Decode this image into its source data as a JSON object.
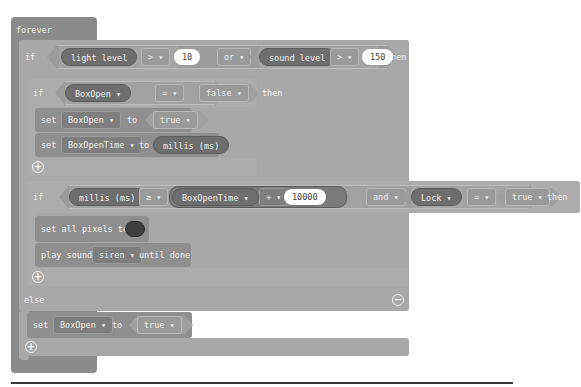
{
  "forever": {
    "label": "forever"
  },
  "if1": {
    "if_label": "if",
    "then_label": "then",
    "left": {
      "reporter": "light level",
      "op": "> ▾",
      "value": "10"
    },
    "logic": "or ▾",
    "right": {
      "reporter": "sound level",
      "op": "> ▾",
      "value": "150"
    }
  },
  "if2": {
    "if_label": "if",
    "then_label": "then",
    "variable": "BoxOpen ▾",
    "op": "= ▾",
    "value": "false ▾",
    "statements": [
      {
        "set_label": "set",
        "variable": "BoxOpen ▾",
        "to_label": "to",
        "value": "true ▾"
      },
      {
        "set_label": "set",
        "variable": "BoxOpenTime ▾",
        "to_label": "to",
        "value": "millis (ms)"
      }
    ]
  },
  "if3": {
    "if_label": "if",
    "then_label": "then",
    "left": {
      "reporter": "millis (ms)",
      "op": "≥ ▾",
      "variable": "BoxOpenTime ▾",
      "arith": "+ ▾",
      "value": "10000"
    },
    "logic": "and ▾",
    "right": {
      "variable": "Lock ▾",
      "op": "= ▾",
      "value": "true ▾"
    },
    "statements": [
      {
        "label": "set all pixels to",
        "color": "#3f3f3f"
      },
      {
        "label_before": "play sound",
        "sound": "siren ▾",
        "label_after": "until done"
      }
    ]
  },
  "else_block": {
    "label": "else",
    "statements": [
      {
        "set_label": "set",
        "variable": "BoxOpen ▾",
        "to_label": "to",
        "value": "true ▾"
      }
    ]
  },
  "icons": {
    "plus": "+",
    "minus": "−"
  }
}
